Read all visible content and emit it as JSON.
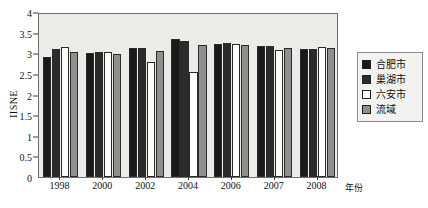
{
  "top_clipped_text": "",
  "legend": {
    "position": "right",
    "entries": [
      {
        "label": "合肥市",
        "color": "#191919"
      },
      {
        "label": "巢湖市",
        "color": "#2b2b2b"
      },
      {
        "label": "六安市",
        "color": "#fbfbf7"
      },
      {
        "label": "流域",
        "color": "#8f8f8f"
      }
    ]
  },
  "chart_data": {
    "type": "bar",
    "title": "",
    "xlabel": "年份",
    "ylabel": "IISNE",
    "ylim": [
      0,
      4
    ],
    "ytick_labels": [
      "0",
      "0.5",
      "1",
      "1.5",
      "2",
      "2.5",
      "3",
      "3.5",
      "4"
    ],
    "yticks": [
      0,
      0.5,
      1,
      1.5,
      2,
      2.5,
      3,
      3.5,
      4
    ],
    "grid": false,
    "categories": [
      "1998",
      "2000",
      "2002",
      "2004",
      "2006",
      "2007",
      "2008"
    ],
    "series": [
      {
        "name": "合肥市",
        "color": "#191919",
        "values": [
          2.92,
          3.0,
          3.13,
          3.35,
          3.22,
          3.18,
          3.1
        ]
      },
      {
        "name": "巢湖市",
        "color": "#2b2b2b",
        "values": [
          3.1,
          3.04,
          3.13,
          3.29,
          3.24,
          3.18,
          3.1
        ]
      },
      {
        "name": "六安市",
        "color": "#fbfbf7",
        "values": [
          3.14,
          3.04,
          2.79,
          2.54,
          3.22,
          3.08,
          3.16
        ]
      },
      {
        "name": "流域",
        "color": "#8f8f8f",
        "values": [
          3.04,
          2.98,
          3.06,
          3.19,
          3.2,
          3.13,
          3.12
        ]
      }
    ]
  }
}
